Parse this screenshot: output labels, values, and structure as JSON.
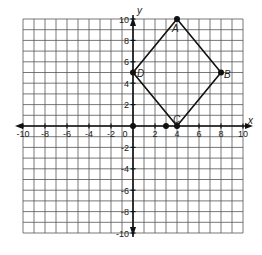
{
  "chart_data": {
    "type": "scatter",
    "title": "",
    "xlabel": "x",
    "ylabel": "y",
    "xlim": [
      -10,
      10
    ],
    "ylim": [
      -10,
      10
    ],
    "grid": true,
    "grid_step": 1,
    "x_ticks": [
      "-10",
      "-8",
      "-6",
      "-4",
      "-2",
      "0",
      "2",
      "4",
      "6",
      "8",
      "10"
    ],
    "y_ticks": [
      "10",
      "8",
      "6",
      "4",
      "2",
      "-2",
      "-4",
      "-6",
      "-8",
      "-10"
    ],
    "points": [
      {
        "label": "A",
        "x": 4,
        "y": 10
      },
      {
        "label": "B",
        "x": 8,
        "y": 5
      },
      {
        "label": "C",
        "x": 4,
        "y": 0
      },
      {
        "label": "D",
        "x": 0,
        "y": 5
      },
      {
        "label": "",
        "x": 0,
        "y": 0
      },
      {
        "label": "",
        "x": 3,
        "y": 0
      }
    ],
    "polygon": {
      "name": "ABCD",
      "vertices": [
        "A",
        "B",
        "C",
        "D"
      ]
    }
  },
  "axes": {
    "x_label": "x",
    "y_label": "y"
  },
  "labels": {
    "A": "A",
    "B": "B",
    "C": "C",
    "D": "D"
  },
  "colors": {
    "grid": "#555555",
    "axis": "#111111",
    "line": "#111111",
    "point": "#111111"
  }
}
